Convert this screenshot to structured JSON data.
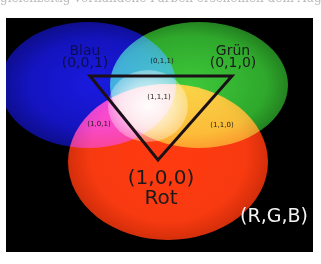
{
  "caption_fragment": "gleichzeitig vorhandene Farben erscheinen dem Auge als weißes Licht",
  "figure": {
    "title": "(R,G,B)",
    "primaries": [
      {
        "name": "Blau",
        "coords": "(0,0,1)",
        "color": "#1414c0"
      },
      {
        "name": "Grün",
        "coords": "(0,1,0)",
        "color": "#2fa82c"
      },
      {
        "name": "Rot",
        "coords": "(1,0,0)",
        "color": "#f83a10"
      }
    ],
    "mixtures": [
      {
        "coords": "(0,1,1)",
        "position": "blue-green overlap"
      },
      {
        "coords": "(1,0,1)",
        "position": "blue-red overlap"
      },
      {
        "coords": "(1,1,0)",
        "position": "green-red overlap"
      },
      {
        "coords": "(1,1,1)",
        "position": "center"
      }
    ]
  }
}
